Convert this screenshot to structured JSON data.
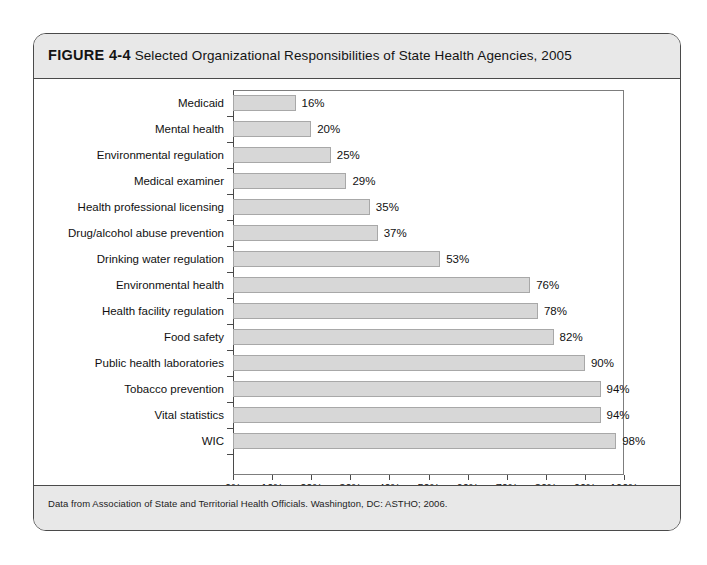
{
  "figure": {
    "number_label": "FIGURE 4-4",
    "caption": "Selected Organizational Responsibilities of State Health Agencies, 2005",
    "source_note": "Data from Association of State and Territorial Health Officials. Washington, DC: ASTHO; 2006."
  },
  "chart_data": {
    "type": "bar",
    "orientation": "horizontal",
    "title": "Selected Organizational Responsibilities of State Health Agencies, 2005",
    "xlabel": "",
    "ylabel": "",
    "xlim": [
      0,
      100
    ],
    "xtick_labels": [
      "0%",
      "10%",
      "20%",
      "30%",
      "40%",
      "50%",
      "60%",
      "70%",
      "80%",
      "90%",
      "100%"
    ],
    "xtick_values": [
      0,
      10,
      20,
      30,
      40,
      50,
      60,
      70,
      80,
      90,
      100
    ],
    "grid": false,
    "legend": null,
    "value_label_suffix": "%",
    "categories": [
      "Medicaid",
      "Mental health",
      "Environmental regulation",
      "Medical examiner",
      "Health professional licensing",
      "Drug/alcohol abuse prevention",
      "Drinking water regulation",
      "Environmental health",
      "Health facility regulation",
      "Food safety",
      "Public health laboratories",
      "Tobacco prevention",
      "Vital statistics",
      "WIC"
    ],
    "values": [
      16,
      20,
      25,
      29,
      35,
      37,
      53,
      76,
      78,
      82,
      90,
      94,
      94,
      98
    ],
    "value_labels": [
      "16%",
      "20%",
      "25%",
      "29%",
      "35%",
      "37%",
      "53%",
      "76%",
      "78%",
      "82%",
      "90%",
      "94%",
      "94%",
      "98%"
    ],
    "colors": {
      "bar_fill": "#d7d7d7",
      "bar_border": "#a8a8a8",
      "axis": "#4a4a4a",
      "band_background": "#e8e8e8",
      "text": "#111111"
    }
  }
}
